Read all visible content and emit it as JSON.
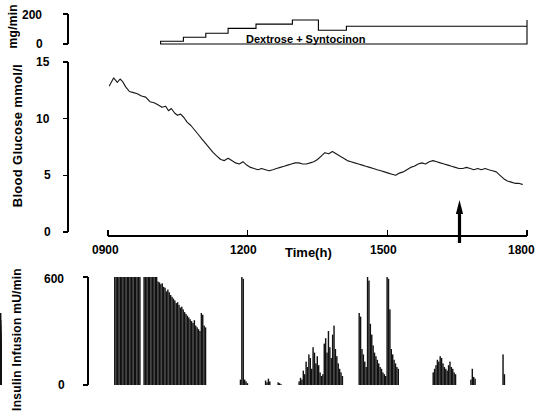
{
  "figure": {
    "background": "#ffffff",
    "ink": "#000000"
  },
  "panels": {
    "infusion_rate": {
      "axis_label": "mg/min",
      "yticks": [
        0,
        200
      ],
      "ytick_labels": [
        "0",
        "200"
      ],
      "ylim": [
        0,
        200
      ],
      "annotation": "Dextrose +  Syntocinon"
    },
    "glucose": {
      "axis_label": "Blood  Glucose  mmol/l",
      "yticks": [
        0,
        5,
        10,
        15
      ],
      "ytick_labels": [
        "0",
        "5",
        "10",
        "15"
      ],
      "ylim": [
        0,
        15
      ]
    },
    "time_axis": {
      "axis_label": "Time(h)",
      "xticks": [
        900,
        1200,
        1500,
        1800
      ],
      "xtick_labels": [
        "0900",
        "1200",
        "1500",
        "1800"
      ],
      "xlim": [
        900,
        1800
      ],
      "marker": {
        "name": "event-arrow",
        "x": 1655,
        "direction": "up"
      }
    },
    "insulin": {
      "axis_label": "Insulin  Infusion  mU/min",
      "yticks": [
        0,
        600
      ],
      "ytick_labels": [
        "0",
        "600"
      ],
      "ylim": [
        0,
        600
      ]
    }
  },
  "chart_data": [
    {
      "type": "area",
      "name": "dextrose-syntocinon-infusion-rate",
      "title": "",
      "xlabel": "",
      "ylabel": "mg/min",
      "ylim": [
        0,
        200
      ],
      "xlim": [
        900,
        1800
      ],
      "annotation": "Dextrose +  Syntocinon",
      "step_profile": {
        "x": [
          1013,
          1040,
          1062,
          1086,
          1110,
          1133,
          1158,
          1186,
          1218,
          1252,
          1296,
          1330,
          1352,
          1382,
          1412,
          1445,
          1800
        ],
        "y": [
          18,
          18,
          45,
          45,
          72,
          72,
          104,
          104,
          133,
          133,
          160,
          160,
          92,
          92,
          118,
          118,
          160
        ]
      }
    },
    {
      "type": "line",
      "name": "blood-glucose",
      "title": "",
      "xlabel": "Time(h)",
      "ylabel": "Blood  Glucose  mmol/l",
      "ylim": [
        0,
        15
      ],
      "xlim": [
        900,
        1800
      ],
      "grid": false,
      "x": [
        903,
        912,
        920,
        926,
        931,
        938,
        946,
        955,
        963,
        972,
        981,
        990,
        999,
        1008,
        1016,
        1024,
        1030,
        1036,
        1043,
        1049,
        1056,
        1063,
        1070,
        1078,
        1086,
        1094,
        1102,
        1110,
        1118,
        1126,
        1134,
        1142,
        1150,
        1158,
        1166,
        1174,
        1182,
        1190,
        1198,
        1206,
        1214,
        1222,
        1230,
        1238,
        1246,
        1254,
        1262,
        1270,
        1278,
        1286,
        1294,
        1302,
        1310,
        1318,
        1326,
        1334,
        1342,
        1350,
        1358,
        1366,
        1374,
        1382,
        1390,
        1398,
        1406,
        1414,
        1422,
        1430,
        1438,
        1446,
        1454,
        1462,
        1470,
        1478,
        1486,
        1494,
        1502,
        1510,
        1518,
        1526,
        1534,
        1542,
        1550,
        1558,
        1566,
        1574,
        1582,
        1590,
        1598,
        1606,
        1614,
        1622,
        1630,
        1638,
        1646,
        1654,
        1662,
        1670,
        1678,
        1686,
        1694,
        1702,
        1710,
        1718,
        1726,
        1734,
        1742,
        1750,
        1758,
        1766,
        1774,
        1782,
        1790,
        1798
      ],
      "y": [
        12.9,
        13.6,
        13.2,
        13.5,
        13.3,
        12.8,
        12.4,
        12.3,
        12.2,
        12.0,
        11.9,
        11.5,
        11.4,
        11.2,
        11.0,
        11.1,
        10.7,
        10.9,
        10.5,
        10.3,
        10.4,
        10.1,
        9.7,
        9.4,
        9.0,
        8.6,
        8.2,
        7.8,
        7.4,
        7.0,
        6.7,
        6.4,
        6.3,
        6.5,
        6.3,
        6.1,
        6.0,
        6.2,
        5.9,
        5.7,
        5.6,
        5.5,
        5.6,
        5.5,
        5.4,
        5.5,
        5.6,
        5.7,
        5.8,
        5.9,
        6.0,
        6.1,
        6.1,
        6.0,
        6.0,
        6.1,
        6.2,
        6.4,
        6.7,
        7.0,
        6.9,
        7.1,
        6.9,
        6.7,
        6.5,
        6.3,
        6.2,
        6.1,
        6.0,
        5.9,
        5.8,
        5.7,
        5.6,
        5.5,
        5.4,
        5.3,
        5.2,
        5.1,
        5.0,
        5.2,
        5.3,
        5.5,
        5.7,
        5.8,
        6.0,
        6.1,
        6.0,
        6.2,
        6.3,
        6.2,
        6.1,
        6.0,
        5.9,
        5.8,
        5.7,
        5.6,
        5.6,
        5.7,
        5.6,
        5.5,
        5.6,
        5.5,
        5.6,
        5.5,
        5.4,
        5.3,
        5.0,
        4.7,
        4.5,
        4.4,
        4.3,
        4.3,
        4.2
      ]
    },
    {
      "type": "bar",
      "name": "insulin-infusion",
      "title": "",
      "xlabel": "",
      "ylabel": "Insulin  Infusion  mU/min",
      "ylim": [
        0,
        600
      ],
      "xlim": [
        900,
        1800
      ],
      "x": [
        913,
        916,
        919,
        922,
        925,
        928,
        931,
        934,
        937,
        940,
        943,
        946,
        949,
        952,
        955,
        958,
        961,
        964,
        967,
        970,
        973,
        976,
        979,
        982,
        985,
        988,
        991,
        994,
        997,
        1000,
        1003,
        1006,
        1009,
        1012,
        1015,
        1018,
        1021,
        1024,
        1027,
        1030,
        1033,
        1036,
        1039,
        1042,
        1045,
        1048,
        1051,
        1054,
        1057,
        1060,
        1063,
        1066,
        1069,
        1072,
        1075,
        1078,
        1081,
        1084,
        1087,
        1090,
        1093,
        1096,
        1099,
        1102,
        1105,
        1108,
        1111,
        1114,
        1117,
        1120,
        1123,
        1126,
        1129,
        1132,
        1135,
        1138,
        1141,
        1144,
        1147,
        1150,
        1153,
        1156,
        1159,
        1162,
        1165,
        1168,
        1171,
        1174,
        1177,
        1180,
        1183,
        1186,
        1189,
        1192,
        1195,
        1198,
        1201,
        1204,
        1207,
        1210,
        1213,
        1216,
        1219,
        1222,
        1225,
        1228,
        1231,
        1234,
        1237,
        1240,
        1243,
        1246,
        1249,
        1252,
        1255,
        1258,
        1261,
        1264,
        1267,
        1270,
        1273,
        1276,
        1279,
        1282,
        1285,
        1288,
        1291,
        1294,
        1297,
        1300,
        1303,
        1306,
        1309,
        1312,
        1315,
        1318,
        1321,
        1324,
        1327,
        1330,
        1333,
        1336,
        1339,
        1342,
        1345,
        1348,
        1351,
        1354,
        1357,
        1360,
        1363,
        1366,
        1369,
        1372,
        1375,
        1378,
        1381,
        1384,
        1387,
        1390,
        1393,
        1396,
        1399,
        1402,
        1405,
        1408,
        1411,
        1414,
        1417,
        1420,
        1423,
        1426,
        1429,
        1432,
        1435,
        1438,
        1441,
        1444,
        1447,
        1450,
        1453,
        1456,
        1459,
        1462,
        1465,
        1468,
        1471,
        1474,
        1477,
        1480,
        1483,
        1486,
        1489,
        1492,
        1495,
        1498,
        1501,
        1504,
        1507,
        1510,
        1513,
        1516,
        1519,
        1522,
        1525,
        1528,
        1531,
        1534,
        1537,
        1540,
        1543,
        1546,
        1549,
        1552,
        1555,
        1558,
        1561,
        1564,
        1567,
        1570,
        1573,
        1576,
        1579,
        1582,
        1585,
        1588,
        1591,
        1594,
        1597,
        1600,
        1603,
        1606,
        1609,
        1612,
        1615,
        1618,
        1621,
        1624,
        1627,
        1630,
        1633,
        1636,
        1639,
        1642,
        1645,
        1648,
        1651,
        1654,
        1657,
        1660,
        1663,
        1666,
        1669,
        1672,
        1675,
        1678,
        1681,
        1684,
        1687,
        1690,
        1693,
        1696,
        1699,
        1702,
        1705,
        1708,
        1711,
        1714,
        1717,
        1720,
        1723,
        1726,
        1729,
        1732,
        1735,
        1738,
        1741,
        1744,
        1747,
        1750,
        1753,
        1756,
        1759,
        1762,
        1765,
        1768,
        1771,
        1774,
        1777,
        1780,
        1783,
        1786,
        1789,
        1792,
        1795,
        1798
      ],
      "values": [
        600,
        600,
        600,
        600,
        600,
        600,
        600,
        600,
        600,
        600,
        600,
        600,
        600,
        600,
        600,
        600,
        600,
        600,
        600,
        0,
        0,
        600,
        600,
        600,
        600,
        600,
        600,
        600,
        600,
        600,
        600,
        575,
        570,
        560,
        565,
        545,
        540,
        520,
        530,
        515,
        500,
        490,
        480,
        470,
        455,
        460,
        445,
        430,
        435,
        420,
        405,
        395,
        385,
        375,
        365,
        355,
        345,
        360,
        330,
        320,
        310,
        300,
        400,
        390,
        330,
        320,
        0,
        0,
        0,
        0,
        0,
        0,
        0,
        0,
        0,
        0,
        0,
        0,
        0,
        0,
        0,
        0,
        0,
        0,
        0,
        0,
        0,
        0,
        0,
        0,
        30,
        600,
        590,
        30,
        20,
        10,
        0,
        0,
        0,
        0,
        0,
        0,
        0,
        0,
        0,
        0,
        0,
        0,
        25,
        15,
        35,
        20,
        0,
        0,
        0,
        0,
        0,
        15,
        10,
        5,
        0,
        0,
        0,
        0,
        0,
        0,
        0,
        0,
        0,
        0,
        0,
        0,
        20,
        40,
        30,
        80,
        60,
        130,
        100,
        170,
        150,
        90,
        210,
        180,
        120,
        160,
        110,
        70,
        50,
        60,
        230,
        260,
        180,
        300,
        210,
        150,
        280,
        330,
        200,
        160,
        120,
        90,
        70,
        50,
        0,
        0,
        0,
        0,
        0,
        0,
        0,
        0,
        0,
        0,
        0,
        400,
        380,
        200,
        170,
        130,
        100,
        600,
        580,
        340,
        280,
        220,
        180,
        160,
        140,
        120,
        100,
        90,
        70,
        60,
        50,
        600,
        590,
        420,
        200,
        170,
        140,
        120,
        100,
        90,
        0,
        0,
        0,
        0,
        0,
        0,
        0,
        0,
        0,
        0,
        0,
        0,
        0,
        0,
        0,
        0,
        0,
        0,
        0,
        0,
        0,
        0,
        0,
        0,
        70,
        90,
        110,
        140,
        130,
        160,
        150,
        120,
        100,
        90,
        80,
        110,
        130,
        100,
        90,
        70,
        60,
        0,
        0,
        0,
        0,
        0,
        0,
        0,
        0,
        0,
        0,
        30,
        90,
        45,
        35,
        0,
        0,
        0,
        0,
        0,
        0,
        0,
        0,
        0,
        0,
        0,
        0,
        0,
        0,
        0,
        0,
        0,
        0,
        0,
        170,
        60,
        0,
        0,
        0,
        0,
        0,
        0,
        0,
        0,
        0,
        0,
        0,
        0,
        0,
        0,
        0,
        0,
        0,
        0,
        0,
        0,
        0,
        0,
        0,
        0,
        0,
        400,
        360,
        260,
        330,
        230,
        300,
        280,
        200,
        250,
        180,
        220,
        210,
        170,
        150,
        140,
        130,
        160,
        120,
        110,
        0,
        0,
        0,
        0,
        0,
        0,
        0,
        0,
        0,
        0,
        0,
        0,
        0,
        0,
        0,
        190,
        200,
        160,
        140,
        150,
        130,
        120,
        0,
        0,
        0,
        0,
        0,
        0,
        0,
        0,
        0,
        0,
        0,
        0,
        0,
        0,
        0,
        0,
        0,
        0,
        0,
        0,
        0,
        0,
        0,
        0,
        0,
        0,
        0,
        0,
        0,
        0,
        0,
        0,
        0,
        0,
        0,
        0,
        0,
        0,
        0
      ]
    }
  ]
}
